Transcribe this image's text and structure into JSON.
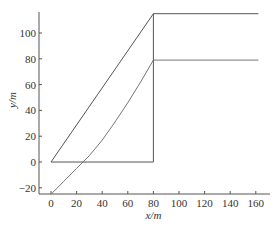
{
  "chart_data": {
    "type": "line",
    "title": "",
    "xlabel": "x/m",
    "ylabel": "y/m",
    "xlim": [
      -5,
      168
    ],
    "ylim": [
      -28,
      115
    ],
    "grid": false,
    "legend": null,
    "xticks": [
      0,
      20,
      40,
      60,
      80,
      100,
      120,
      140,
      160
    ],
    "yticks": [
      -20,
      0,
      20,
      40,
      60,
      80,
      100
    ],
    "series": [
      {
        "name": "upper boundary",
        "x": [
          0,
          80,
          162
        ],
        "y": [
          0,
          115,
          115
        ]
      },
      {
        "name": "lower curve",
        "x": [
          0,
          10,
          20,
          25,
          30,
          40,
          50,
          60,
          70,
          80,
          162
        ],
        "y": [
          -25,
          -15,
          -5,
          0,
          5,
          17,
          31,
          46,
          62,
          79,
          79
        ]
      },
      {
        "name": "baseline and vertical",
        "x": [
          0,
          80,
          80
        ],
        "y": [
          0,
          0,
          115
        ]
      }
    ]
  },
  "axes": {
    "xlabel": "x/m",
    "ylabel": "y/m",
    "xticks": [
      "0",
      "20",
      "40",
      "60",
      "80",
      "100",
      "120",
      "140",
      "160"
    ],
    "yticks": [
      "-20",
      "0",
      "20",
      "40",
      "60",
      "80",
      "100"
    ]
  }
}
